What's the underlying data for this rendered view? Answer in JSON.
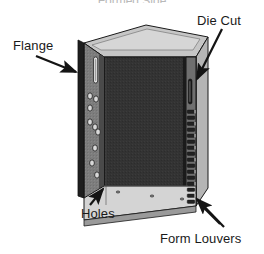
{
  "figure": {
    "title": "Formed Side",
    "type": "isometric-technical-illustration",
    "background_color": "#ffffff",
    "colors": {
      "front_panel_dark": "#333333",
      "flange_face_gray": "#7a7a7a",
      "top_face_light": "#c9c9c9",
      "bottom_flange_light": "#d2d2d2",
      "edge_dark": "#1c1c1c",
      "outline": "#111111",
      "label_text": "#1a1a1a",
      "title_text": "#b9b9b9"
    }
  },
  "callouts": [
    {
      "id": "flange",
      "label": "Flange",
      "position": "left",
      "arrow": {
        "from_x": 36,
        "from_y": 56,
        "to_x": 78,
        "to_y": 73
      }
    },
    {
      "id": "die-cut",
      "label": "Die Cut",
      "position": "top-right",
      "arrow": {
        "from_x": 222,
        "from_y": 29,
        "to_x": 196,
        "to_y": 80
      }
    },
    {
      "id": "holes",
      "label": "Holes",
      "position": "bottom-left",
      "arrow": {
        "from_x": 90,
        "from_y": 204,
        "to_x": 104,
        "to_y": 188
      }
    },
    {
      "id": "form-louvers",
      "label": "Form Louvers",
      "position": "bottom-right",
      "arrow": {
        "from_x": 223,
        "from_y": 226,
        "to_x": 196,
        "to_y": 198
      }
    }
  ],
  "features": {
    "left_flange": {
      "name": "Flange",
      "slot_count": 1,
      "hole_count": 8,
      "hole_shape": "ellipse"
    },
    "right_flange": {
      "name": "Die Cut and Form Louvers",
      "die_cut_slot_count": 1,
      "louver_count": 17
    },
    "bottom_flange": {
      "name": "Holes",
      "hole_count": 3
    }
  }
}
